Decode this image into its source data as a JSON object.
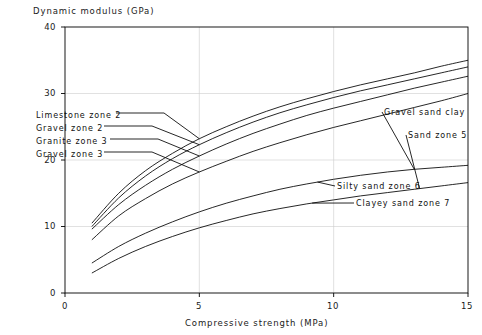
{
  "chart_data": {
    "type": "line",
    "title": "",
    "xlabel": "Compressive strength (MPa)",
    "ylabel": "Dynamic modulus (GPa)",
    "xlim": [
      0,
      15
    ],
    "ylim": [
      0,
      40
    ],
    "xticks": [
      "0",
      "5",
      "10",
      "15"
    ],
    "yticks": [
      "0",
      "10",
      "20",
      "30",
      "40"
    ],
    "grid": true,
    "legend_position": "inline-annotations",
    "x": [
      1,
      2,
      3,
      4,
      5,
      6,
      7,
      8,
      9,
      10,
      11,
      12,
      13,
      14,
      15
    ],
    "series": [
      {
        "name": "Limestone zone 2",
        "label_side": "left",
        "values": [
          10.5,
          15.0,
          18.4,
          21.0,
          23.2,
          25.0,
          26.6,
          28.0,
          29.2,
          30.3,
          31.3,
          32.2,
          33.1,
          34.1,
          35.0
        ]
      },
      {
        "name": "Gravel zone 2",
        "label_side": "left",
        "values": [
          10.0,
          14.3,
          17.6,
          20.2,
          22.3,
          24.1,
          25.7,
          27.1,
          28.3,
          29.4,
          30.4,
          31.3,
          32.2,
          33.1,
          34.0
        ]
      },
      {
        "name": "Granite zone 3",
        "label_side": "left",
        "values": [
          9.6,
          13.3,
          16.2,
          18.6,
          20.6,
          22.4,
          24.0,
          25.4,
          26.7,
          27.8,
          28.8,
          29.8,
          30.8,
          31.7,
          32.6
        ]
      },
      {
        "name": "Gravel zone 3",
        "label_side": "left",
        "values": [
          8.0,
          11.6,
          14.2,
          16.4,
          18.2,
          19.8,
          21.3,
          22.6,
          23.8,
          24.9,
          25.9,
          26.9,
          27.9,
          28.9,
          30.0
        ]
      },
      {
        "name": "Gravel sand clay",
        "label_side": "right",
        "values": [
          4.5,
          7.0,
          9.0,
          10.7,
          12.2,
          13.5,
          14.6,
          15.6,
          16.4,
          17.1,
          17.7,
          18.2,
          18.6,
          18.9,
          19.2
        ]
      },
      {
        "name": "Sand zone 5",
        "label_side": "right",
        "values": [
          3.0,
          5.2,
          7.0,
          8.5,
          9.8,
          10.9,
          11.9,
          12.7,
          13.4,
          14.0,
          14.6,
          15.1,
          15.6,
          16.1,
          16.6
        ]
      }
    ],
    "annotations": [
      {
        "text": "Limestone zone 2",
        "group": "left-labels"
      },
      {
        "text": "Gravel zone 2",
        "group": "left-labels"
      },
      {
        "text": "Granite zone 3",
        "group": "left-labels"
      },
      {
        "text": "Gravel zone 3",
        "group": "left-labels"
      },
      {
        "text": "Gravel sand clay",
        "group": "right-labels"
      },
      {
        "text": "Sand zone 5",
        "group": "right-labels"
      },
      {
        "text": "Silty sand zone 6",
        "group": "right-labels"
      },
      {
        "text": "Clayey sand zone 7",
        "group": "right-labels"
      }
    ]
  },
  "axes": {
    "y_title": "Dynamic modulus (GPa)",
    "x_title": "Compressive strength (MPa)",
    "y_ticks": [
      {
        "label": "40"
      },
      {
        "label": "30"
      },
      {
        "label": "20"
      },
      {
        "label": "10"
      },
      {
        "label": "0"
      }
    ],
    "x_ticks": [
      {
        "label": "0"
      },
      {
        "label": "5"
      },
      {
        "label": "10"
      },
      {
        "label": "15"
      }
    ]
  },
  "labels": {
    "limestone_zone_2": "Limestone zone 2",
    "gravel_zone_2": "Gravel zone 2",
    "granite_zone_3": "Granite zone 3",
    "gravel_zone_3": "Gravel zone 3",
    "gravel_sand_clay": "Gravel sand clay",
    "sand_zone_5": "Sand zone 5",
    "silty_sand_zone_6": "Silty sand zone 6",
    "clayey_sand_zone_7": "Clayey sand zone 7"
  },
  "colors": {
    "line": "#000000",
    "grid": "#cccccc",
    "axis": "#000000",
    "text": "#111111",
    "background": "#ffffff"
  }
}
